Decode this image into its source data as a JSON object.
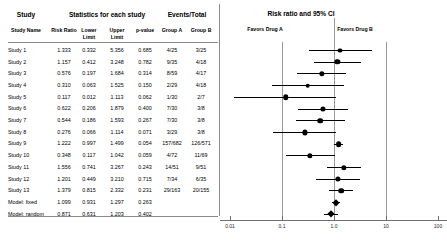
{
  "table": {
    "group_headers": [
      {
        "label": "Study",
        "x": 26
      },
      {
        "label": "Statistics for each study",
        "x": 107
      },
      {
        "label": "Events/Total",
        "x": 187
      }
    ],
    "columns": [
      {
        "key": "study",
        "label": "Study Name",
        "x": 26,
        "align": "center"
      },
      {
        "key": "rr",
        "label": "Risk Ratio",
        "x": 64,
        "align": "center"
      },
      {
        "key": "lower",
        "label": "Lower",
        "label2": "Limit",
        "x": 89,
        "align": "center"
      },
      {
        "key": "upper",
        "label": "Upper",
        "label2": "Limit",
        "x": 117,
        "align": "center"
      },
      {
        "key": "p",
        "label": "p-value",
        "x": 145,
        "align": "center"
      },
      {
        "key": "ga",
        "label": "Group A",
        "x": 172,
        "align": "center"
      },
      {
        "key": "gb",
        "label": "Group B",
        "x": 201,
        "align": "center"
      }
    ],
    "rows": [
      {
        "study": "Study 1",
        "rr": "1.333",
        "lower": "0.332",
        "upper": "5.356",
        "p": "0.685",
        "ga": "4/25",
        "gb": "3/25",
        "rr_v": 1.333,
        "lo_v": 0.332,
        "hi_v": 5.356,
        "size": 3.1,
        "type": "study"
      },
      {
        "study": "Study 2",
        "rr": "1.157",
        "lower": "0.412",
        "upper": "3.248",
        "p": "0.782",
        "ga": "9/35",
        "gb": "4/18",
        "rr_v": 1.157,
        "lo_v": 0.412,
        "hi_v": 3.248,
        "size": 3.3,
        "type": "study"
      },
      {
        "study": "Study 3",
        "rr": "0.576",
        "lower": "0.197",
        "upper": "1.684",
        "p": "0.314",
        "ga": "8/59",
        "gb": "4/17",
        "rr_v": 0.576,
        "lo_v": 0.197,
        "hi_v": 1.684,
        "size": 3.3,
        "type": "study"
      },
      {
        "study": "Study 4",
        "rr": "0.310",
        "lower": "0.063",
        "upper": "1.525",
        "p": "0.150",
        "ga": "2/29",
        "gb": "4/18",
        "rr_v": 0.31,
        "lo_v": 0.063,
        "hi_v": 1.525,
        "size": 2.9,
        "type": "study"
      },
      {
        "study": "Study 5",
        "rr": "0.117",
        "lower": "0.012",
        "upper": "1.113",
        "p": "0.062",
        "ga": "1/30",
        "gb": "2/7",
        "rr_v": 0.117,
        "lo_v": 0.012,
        "hi_v": 1.113,
        "size": 3.4,
        "type": "study"
      },
      {
        "study": "Study 6",
        "rr": "0.622",
        "lower": "0.206",
        "upper": "1.879",
        "p": "0.400",
        "ga": "7/30",
        "gb": "3/8",
        "rr_v": 0.622,
        "lo_v": 0.206,
        "hi_v": 1.879,
        "size": 3.2,
        "type": "study"
      },
      {
        "study": "Study 7",
        "rr": "0.544",
        "lower": "0.186",
        "upper": "1.593",
        "p": "0.267",
        "ga": "7/30",
        "gb": "3/8",
        "rr_v": 0.544,
        "lo_v": 0.186,
        "hi_v": 1.593,
        "size": 3.5,
        "type": "study"
      },
      {
        "study": "Study 8",
        "rr": "0.276",
        "lower": "0.066",
        "upper": "1.114",
        "p": "0.071",
        "ga": "3/29",
        "gb": "3/8",
        "rr_v": 0.276,
        "lo_v": 0.066,
        "hi_v": 1.114,
        "size": 3.2,
        "type": "study"
      },
      {
        "study": "Study 9",
        "rr": "1.222",
        "lower": "0.997",
        "upper": "1.499",
        "p": "0.054",
        "ga": "157/682",
        "gb": "126/571",
        "rr_v": 1.222,
        "lo_v": 0.997,
        "hi_v": 1.499,
        "size": 3.6,
        "type": "study"
      },
      {
        "study": "Study 10",
        "rr": "0.348",
        "lower": "0.117",
        "upper": "1.042",
        "p": "0.059",
        "ga": "4/72",
        "gb": "11/69",
        "rr_v": 0.348,
        "lo_v": 0.117,
        "hi_v": 1.042,
        "size": 3.3,
        "type": "study"
      },
      {
        "study": "Study 11",
        "rr": "1.556",
        "lower": "0.741",
        "upper": "3.267",
        "p": "0.243",
        "ga": "14/51",
        "gb": "9/51",
        "rr_v": 1.556,
        "lo_v": 0.741,
        "hi_v": 3.267,
        "size": 3.3,
        "type": "study"
      },
      {
        "study": "Study 12",
        "rr": "1.201",
        "lower": "0.449",
        "upper": "3.210",
        "p": "0.715",
        "ga": "7/34",
        "gb": "6/35",
        "rr_v": 1.201,
        "lo_v": 0.449,
        "hi_v": 3.21,
        "size": 3.2,
        "type": "study"
      },
      {
        "study": "Study 13",
        "rr": "1.379",
        "lower": "0.815",
        "upper": "2.332",
        "p": "0.231",
        "ga": "29/163",
        "gb": "20/155",
        "rr_v": 1.379,
        "lo_v": 0.815,
        "hi_v": 2.332,
        "size": 3.5,
        "type": "study"
      },
      {
        "study": "Model: fixed",
        "rr": "1.099",
        "lower": "0.931",
        "upper": "1.297",
        "p": "0.263",
        "ga": "",
        "gb": "",
        "rr_v": 1.099,
        "lo_v": 0.931,
        "hi_v": 1.297,
        "size": 3.6,
        "type": "model"
      },
      {
        "study": "Model: random",
        "rr": "0.871",
        "lower": "0.631",
        "upper": "1.203",
        "p": "0.402",
        "ga": "",
        "gb": "",
        "rr_v": 0.871,
        "lo_v": 0.631,
        "hi_v": 1.203,
        "size": 3.6,
        "type": "model"
      }
    ]
  },
  "plot": {
    "title": "Risk ratio and 95% CI",
    "favors_left": "Favors Drug A",
    "favors_right": "Favors Drug B",
    "scale": "log",
    "xmin": 0.01,
    "xmax": 100,
    "null_value": 1.0,
    "ticks": [
      "0.01",
      "0.1",
      "1.0",
      "10",
      "100"
    ],
    "tick_values": [
      0.01,
      0.1,
      1,
      10,
      100
    ],
    "gridlines": [
      0.1,
      1,
      10
    ]
  },
  "chart_data": {
    "type": "forest",
    "title": "Risk ratio and 95% CI",
    "xlabel": "",
    "ylabel": "",
    "xscale": "log",
    "xlim": [
      0.01,
      100
    ],
    "xticks": [
      0.01,
      0.1,
      1,
      10,
      100
    ],
    "reference_line": 1.0,
    "effect_measure": "Risk Ratio",
    "favors_left_label": "Favors Drug A",
    "favors_right_label": "Favors Drug B",
    "categories": [
      "Study 1",
      "Study 2",
      "Study 3",
      "Study 4",
      "Study 5",
      "Study 6",
      "Study 7",
      "Study 8",
      "Study 9",
      "Study 10",
      "Study 11",
      "Study 12",
      "Study 13",
      "Model: fixed",
      "Model: random"
    ],
    "point_estimates": [
      1.333,
      1.157,
      0.576,
      0.31,
      0.117,
      0.622,
      0.544,
      0.276,
      1.222,
      0.348,
      1.556,
      1.201,
      1.379,
      1.099,
      0.871
    ],
    "ci_lower": [
      0.332,
      0.412,
      0.197,
      0.063,
      0.012,
      0.206,
      0.186,
      0.066,
      0.997,
      0.117,
      0.741,
      0.449,
      0.815,
      0.931,
      0.631
    ],
    "ci_upper": [
      5.356,
      3.248,
      1.684,
      1.525,
      1.113,
      1.879,
      1.593,
      1.114,
      1.499,
      1.042,
      3.267,
      3.21,
      2.332,
      1.297,
      1.203
    ],
    "p_values": [
      0.685,
      0.782,
      0.314,
      0.15,
      0.062,
      0.4,
      0.267,
      0.071,
      0.054,
      0.059,
      0.243,
      0.715,
      0.231,
      0.263,
      0.402
    ],
    "events_group_a": [
      "4/25",
      "9/35",
      "8/59",
      "2/29",
      "1/30",
      "7/30",
      "7/30",
      "3/29",
      "157/682",
      "4/72",
      "14/51",
      "7/34",
      "29/163",
      "",
      ""
    ],
    "events_group_b": [
      "3/25",
      "4/18",
      "4/17",
      "4/18",
      "2/7",
      "3/8",
      "3/8",
      "3/8",
      "126/571",
      "11/69",
      "9/51",
      "6/35",
      "20/155",
      "",
      ""
    ]
  }
}
